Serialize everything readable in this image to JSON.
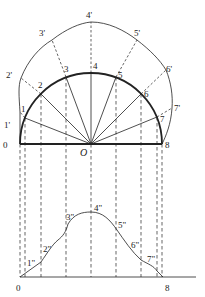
{
  "figure": {
    "center_label": "O",
    "semicircle_points": [
      "0",
      "1",
      "2",
      "3",
      "4",
      "5",
      "6",
      "7",
      "8"
    ],
    "outer_points": [
      "1'",
      "2'",
      "3'",
      "4'",
      "5'",
      "6'",
      "7'"
    ],
    "development_points": [
      "1\"",
      "2\"",
      "3\"",
      "4\"",
      "5\"",
      "6\"",
      "7\""
    ],
    "development_end_labels": [
      "0",
      "8"
    ],
    "colors": {
      "stroke": "#222222",
      "background": "#ffffff"
    }
  }
}
